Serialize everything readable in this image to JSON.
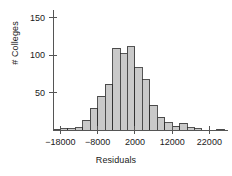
{
  "chart_data": {
    "type": "bar",
    "title": "",
    "xlabel": "Residuals",
    "ylabel": "# Colleges",
    "grid": false,
    "legend": false,
    "bin_width": 2000,
    "xlim": [
      -20000,
      27000
    ],
    "ylim": [
      0,
      160
    ],
    "xticks": [
      -18000,
      -8000,
      2000,
      12000,
      22000
    ],
    "xticklabels": [
      "−18000",
      "−8000",
      "2000",
      "12000",
      "22000"
    ],
    "yticks": [
      50,
      100,
      150
    ],
    "yticklabels": [
      "50",
      "100",
      "150"
    ],
    "bar_fill": "#c9c9c9",
    "bar_stroke": "#2b2b2b",
    "axis_color": "#555555",
    "bin_starts": [
      -20000,
      -18000,
      -16000,
      -14000,
      -12000,
      -10000,
      -8000,
      -6000,
      -4000,
      -2000,
      0,
      2000,
      4000,
      6000,
      8000,
      10000,
      12000,
      14000,
      16000,
      18000,
      20000,
      22000,
      24000
    ],
    "categories": [
      "-20000",
      "-18000",
      "-16000",
      "-14000",
      "-12000",
      "-10000",
      "-8000",
      "-6000",
      "-4000",
      "-2000",
      "0",
      "2000",
      "4000",
      "6000",
      "8000",
      "10000",
      "12000",
      "14000",
      "16000",
      "18000",
      "20000",
      "22000",
      "24000"
    ],
    "values": [
      1,
      2,
      2,
      3,
      13,
      29,
      45,
      61,
      109,
      102,
      111,
      83,
      67,
      33,
      17,
      10,
      5,
      9,
      3,
      2,
      0,
      0,
      1
    ]
  },
  "figure": {
    "background": "#ffffff",
    "width": 232,
    "height": 176
  }
}
